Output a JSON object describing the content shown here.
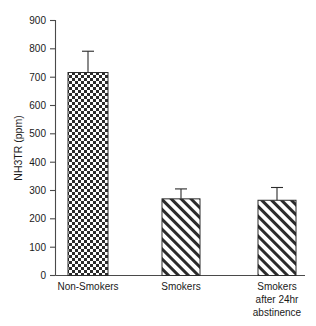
{
  "chart_data": {
    "type": "bar",
    "title": "",
    "subtitle": "",
    "xlabel": "",
    "ylabel": "NH3TR (ppm)",
    "ylim": [
      0,
      900
    ],
    "ytick_step": 100,
    "yticks": [
      0,
      100,
      200,
      300,
      400,
      500,
      600,
      700,
      800,
      900
    ],
    "ytick_labels": [
      "0",
      "100",
      "200",
      "300",
      "400",
      "500",
      "600",
      "700",
      "800",
      "900"
    ],
    "grid": false,
    "legend": null,
    "legend_position": "none",
    "categories": [
      "Non-Smokers",
      "Smokers",
      "Smokers after 24hr abstinence"
    ],
    "category_label_lines": [
      [
        "Non-Smokers"
      ],
      [
        "Smokers"
      ],
      [
        "Smokers",
        "after 24hr",
        "abstinence"
      ]
    ],
    "values": [
      715,
      270,
      265
    ],
    "errors": [
      75,
      35,
      45
    ],
    "bar_patterns": [
      "checkerboard",
      "diagonal-hatch",
      "diagonal-hatch"
    ],
    "series": [
      {
        "name": "NH3TR",
        "values": [
          715,
          270,
          265
        ],
        "errors": [
          75,
          35,
          45
        ]
      }
    ],
    "colors": {
      "background": "#ffffff",
      "axis": "#4a4a4a",
      "bar_outline": "#2b2b2b",
      "pattern": "#2b2b2b",
      "text": "#1a1a1a"
    }
  }
}
